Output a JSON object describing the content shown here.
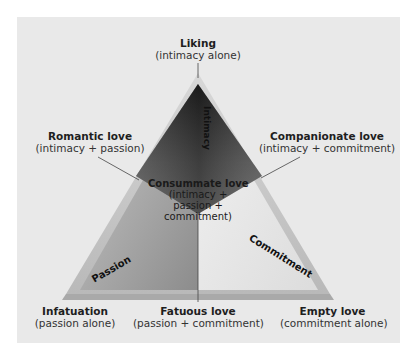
{
  "diagram": {
    "colors": {
      "panel_background": "#e9e9e9",
      "apex_dark": "#2b2b2b",
      "passion_face": "#9a9a9a",
      "commitment_face": "#e4e4e4",
      "frame": "#cfcfcf"
    },
    "sides": {
      "intimacy": "Intimacy",
      "passion": "Passion",
      "commitment": "Commitment"
    },
    "vertices": {
      "top": {
        "title": "Liking",
        "subtitle": "(intimacy alone)"
      },
      "bottom_left": {
        "title": "Infatuation",
        "subtitle": "(passion alone)"
      },
      "bottom_right": {
        "title": "Empty love",
        "subtitle": "(commitment alone)"
      }
    },
    "edges": {
      "left": {
        "title": "Romantic love",
        "subtitle": "(intimacy + passion)"
      },
      "right": {
        "title": "Companionate love",
        "subtitle": "(intimacy + commitment)"
      },
      "bottom": {
        "title": "Fatuous love",
        "subtitle": "(passion + commitment)"
      }
    },
    "center": {
      "title": "Consummate love",
      "line1": "(intimacy +",
      "line2": "passion +",
      "line3": "commitment)"
    }
  }
}
